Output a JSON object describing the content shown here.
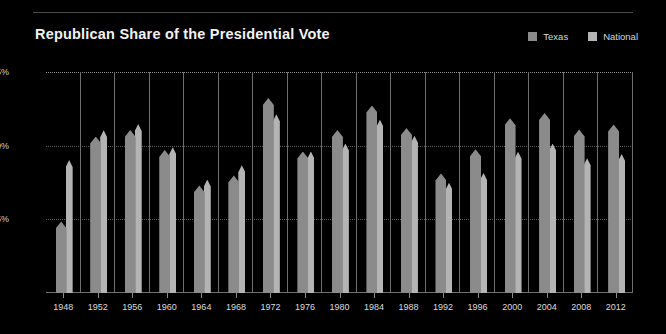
{
  "chart_data": {
    "type": "bar",
    "title": "Republican Share of the Presidential Vote",
    "xlabel": "",
    "ylabel": "",
    "ylim": [
      0,
      75
    ],
    "grid": true,
    "legend_position": "top-right",
    "ytick_labels": [
      "75%",
      "50%",
      "25%"
    ],
    "ytick_values": [
      75,
      50,
      25
    ],
    "categories": [
      1948,
      1952,
      1956,
      1960,
      1964,
      1968,
      1972,
      1976,
      1980,
      1984,
      1988,
      1992,
      1996,
      2000,
      2004,
      2008,
      2012
    ],
    "series": [
      {
        "name": "Texas",
        "color": "#8b8b8b",
        "values": [
          24.3,
          53.1,
          55.3,
          48.5,
          36.5,
          39.9,
          66.2,
          48.0,
          55.3,
          63.6,
          56.0,
          40.6,
          48.8,
          59.3,
          61.1,
          55.5,
          57.2
        ]
      },
      {
        "name": "National",
        "color": "#b4b4b4",
        "values": [
          45.1,
          55.2,
          57.4,
          49.5,
          38.5,
          43.4,
          60.7,
          48.0,
          50.7,
          58.8,
          53.4,
          37.4,
          40.7,
          47.9,
          50.7,
          45.7,
          47.2
        ]
      }
    ]
  },
  "legend": {
    "items": [
      {
        "label": "Texas",
        "color": "#8b8b8b"
      },
      {
        "label": "National",
        "color": "#b4b4b4"
      }
    ]
  },
  "theme": {
    "background": "#000000",
    "text": "#e8e8e8",
    "gridline": "#5a5a5a",
    "axis": "#707070"
  }
}
